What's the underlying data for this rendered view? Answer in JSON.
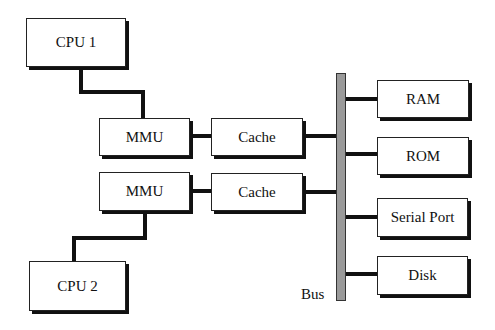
{
  "diagram": {
    "nodes": {
      "cpu1": "CPU 1",
      "cpu2": "CPU 2",
      "mmu1": "MMU",
      "mmu2": "MMU",
      "cache1": "Cache",
      "cache2": "Cache",
      "ram": "RAM",
      "rom": "ROM",
      "serial": "Serial Port",
      "disk": "Disk"
    },
    "bus_label": "Bus",
    "edges": [
      [
        "CPU 1",
        "MMU (1)"
      ],
      [
        "MMU (1)",
        "Cache (1)"
      ],
      [
        "Cache (1)",
        "Bus"
      ],
      [
        "CPU 2",
        "MMU (2)"
      ],
      [
        "MMU (2)",
        "Cache (2)"
      ],
      [
        "Cache (2)",
        "Bus"
      ],
      [
        "Bus",
        "RAM"
      ],
      [
        "Bus",
        "ROM"
      ],
      [
        "Bus",
        "Serial Port"
      ],
      [
        "Bus",
        "Disk"
      ]
    ],
    "colors": {
      "bus_fill": "#9a9a9a",
      "lines": "#111111",
      "box_fill": "#ffffff"
    }
  }
}
